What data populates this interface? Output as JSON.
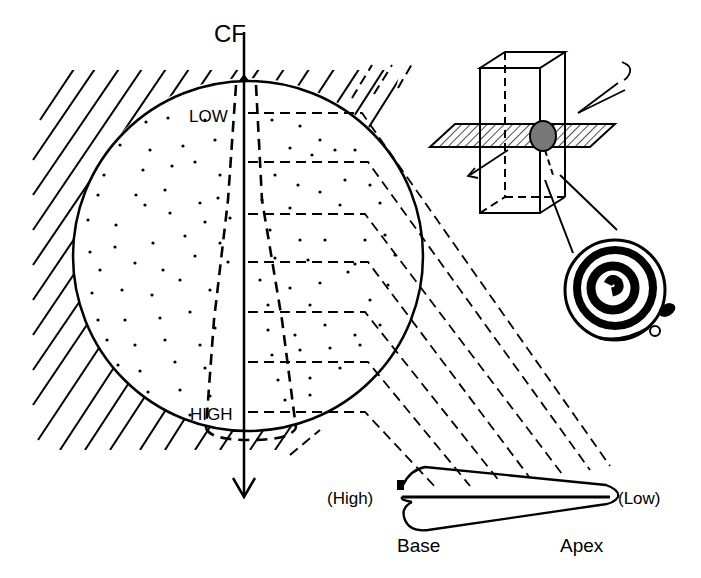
{
  "figure": {
    "type": "tonotopic-projection-diagram",
    "background": "#ffffff",
    "ink": "#000000",
    "axis_label": "CF",
    "nucleus_labels": {
      "top": "LOW",
      "bottom": "HIGH"
    },
    "cochlea_labels": {
      "left_end": "(High)",
      "right_end": "(Low)",
      "base": "Base",
      "apex": "Apex"
    },
    "iso_frequency_bands": 7,
    "inset": {
      "description": "3D block with horizontal section plane through nucleus, linked to spiral cochlea",
      "icons": [
        "section-block-icon",
        "cutting-plane-icon",
        "electrode-icon",
        "spiral-cochlea-icon"
      ]
    }
  }
}
